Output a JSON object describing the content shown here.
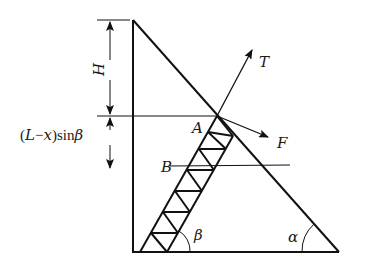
{
  "figure": {
    "labels": {
      "H": "H",
      "dim_lower_prefix": "(",
      "dim_lower_L": "L",
      "dim_lower_minus": "−",
      "dim_lower_x": "x",
      "dim_lower_close": ")sin",
      "dim_lower_beta": "β",
      "A": "A",
      "B": "B",
      "T": "T",
      "F": "F",
      "beta": "β",
      "alpha": "α"
    }
  },
  "colors": {
    "line": "#111111",
    "background": "#ffffff"
  }
}
